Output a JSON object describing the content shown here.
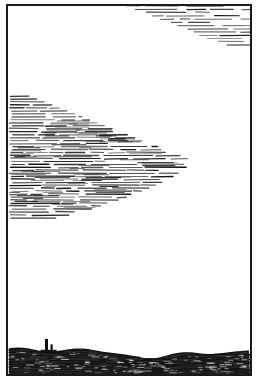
{
  "artwork": {
    "title": "Cloudscape over dark plain",
    "medium": "pen-and-ink hatched engraving",
    "alt_text": "A white sky with horizontally hatched clouds above a dark hatched plain with a small tower on the horizon.",
    "width": 259,
    "height": 380,
    "colors": {
      "ink": "#111111",
      "paper": "#ffffff",
      "ground_fill": "#2b2b2b",
      "frame": "#1a1a1a"
    }
  },
  "frame": {
    "name": "border-rectangle",
    "x": 7,
    "y": 5,
    "width": 244,
    "height": 370,
    "stroke_width": 2
  },
  "sky": {
    "name": "sky-area",
    "fill": "#ffffff",
    "top": 5,
    "bottom": 352
  },
  "clouds": [
    {
      "id": "upper-right-cloud",
      "label": "Upper right cloud band",
      "hatch_rows": 13,
      "row_spacing": 3.0,
      "top": 6,
      "bottom": 45,
      "left_tip_x": 126,
      "right_x": 250,
      "density": 0.55
    },
    {
      "id": "main-cloud-bank",
      "label": "Main wedge cloud bank",
      "hatch_rows": 42,
      "row_spacing": 2.9,
      "top": 96,
      "bottom": 218,
      "left_x": 9,
      "right_x": 192,
      "density": 0.92
    }
  ],
  "ground": {
    "name": "dark-plain",
    "label": "Dark hatched ground",
    "horizon_y": 353,
    "bottom_y": 375,
    "hatch_rows": 11,
    "row_spacing": 2.1,
    "undulation_amplitude": 4
  },
  "landmark": {
    "name": "tower-silhouette",
    "label": "Tower on horizon",
    "x": 45,
    "base_y": 353,
    "height": 14,
    "width": 3
  }
}
